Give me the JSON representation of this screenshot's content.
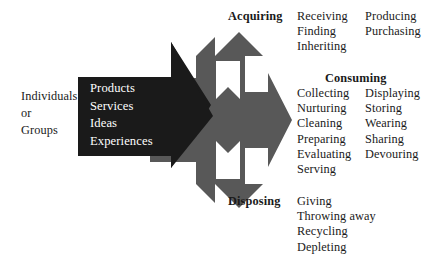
{
  "diagram": {
    "colors": {
      "background": "#ffffff",
      "input_arrow": "#1a1a1a",
      "process_arrow": "#585858",
      "notch": "#ffffff",
      "text": "#1a1a1a",
      "inverse_text": "#ffffff"
    },
    "source": {
      "lines": [
        "Individuals",
        "or",
        "Groups"
      ]
    },
    "flow": {
      "lines": [
        "Products",
        "Services",
        "Ideas",
        "Experiences"
      ]
    },
    "branches": [
      {
        "heading": "Acquiring",
        "column_1": [
          "Receiving",
          "Finding",
          "Inheriting"
        ],
        "column_2": [
          "Producing",
          "Purchasing"
        ]
      },
      {
        "heading": "Consuming",
        "column_1": [
          "Collecting",
          "Nurturing",
          "Cleaning",
          "Preparing",
          "Evaluating",
          "Serving"
        ],
        "column_2": [
          "Displaying",
          "Storing",
          "Wearing",
          "Sharing",
          "Devouring"
        ]
      },
      {
        "heading": "Disposing",
        "column_1": [
          "Giving",
          "Throwing away",
          "Recycling",
          "Depleting"
        ],
        "column_2": []
      }
    ]
  }
}
